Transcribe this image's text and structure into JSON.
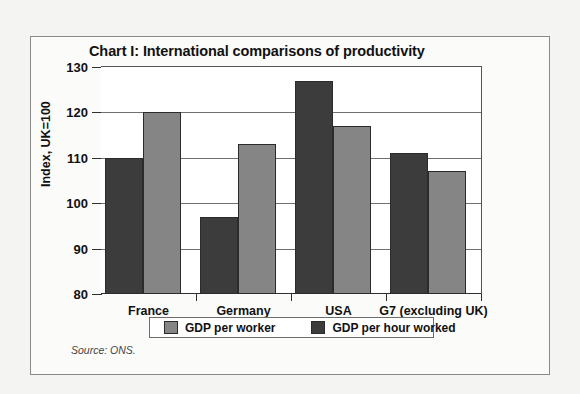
{
  "figure": {
    "title": "Chart I: International comparisons of productivity",
    "source": "Source: ONS.",
    "colors": {
      "gdp_per_worker": "#858585",
      "gdp_per_hour_worked": "#3c3c3c",
      "axis": "#2f2f2f",
      "gridline": "#6f6f6f",
      "plot_background": "#ffffff",
      "figure_background": "#fbfbfa"
    }
  },
  "chart_data": {
    "type": "bar",
    "title": "Chart I: International comparisons of productivity",
    "xlabel": "",
    "ylabel": "Index, UK=100",
    "ylim": [
      80,
      130
    ],
    "yticks": [
      80,
      90,
      100,
      110,
      120,
      130
    ],
    "ytick_labels": [
      "80",
      "90",
      "100",
      "110",
      "120",
      "130"
    ],
    "grid": true,
    "legend_position": "bottom",
    "categories": [
      "France",
      "Germany",
      "USA",
      "G7 (excluding UK)"
    ],
    "series": [
      {
        "name": "GDP per hour worked",
        "color": "#3c3c3c",
        "values": [
          110,
          97,
          127,
          111
        ]
      },
      {
        "name": "GDP per worker",
        "color": "#858585",
        "values": [
          120,
          113,
          117,
          107
        ]
      }
    ]
  },
  "legend": {
    "items": [
      {
        "label": "GDP per worker",
        "swatch": "#858585"
      },
      {
        "label": "GDP per hour worked",
        "swatch": "#3c3c3c"
      }
    ]
  }
}
